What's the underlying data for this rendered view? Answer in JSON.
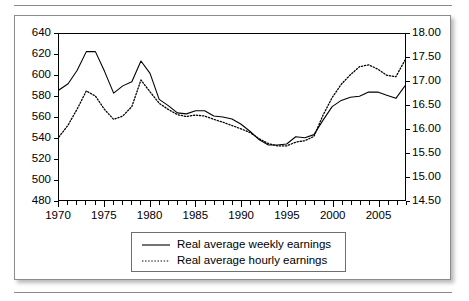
{
  "chart_data": {
    "type": "line",
    "title": "",
    "subtitle": "",
    "xlabel": "",
    "ylabel": "",
    "grid": false,
    "legend_position": "bottom-center",
    "x": [
      1970,
      1971,
      1972,
      1973,
      1974,
      1975,
      1976,
      1977,
      1978,
      1979,
      1980,
      1981,
      1982,
      1983,
      1984,
      1985,
      1986,
      1987,
      1988,
      1989,
      1990,
      1991,
      1992,
      1993,
      1994,
      1995,
      1996,
      1997,
      1998,
      1999,
      2000,
      2001,
      2002,
      2003,
      2004,
      2005,
      2006,
      2007,
      2008
    ],
    "xlim": [
      1970,
      2008
    ],
    "xticks": [
      1970,
      1975,
      1980,
      1985,
      1990,
      1995,
      2000,
      2005
    ],
    "xticklabels": [
      "1970",
      "1975",
      "1980",
      "1985",
      "1990",
      "1995",
      "2000",
      "2005"
    ],
    "minor_xticks_every": 1,
    "axes": [
      {
        "id": "left",
        "name": "Real average weekly earnings",
        "ylim": [
          480,
          640
        ],
        "yticks": [
          480,
          500,
          520,
          540,
          560,
          580,
          600,
          620,
          640
        ],
        "yticklabels": [
          "480",
          "500",
          "520",
          "540",
          "560",
          "580",
          "600",
          "620",
          "640"
        ]
      },
      {
        "id": "right",
        "name": "Real average hourly earnings",
        "ylim": [
          14.5,
          18.0
        ],
        "yticks": [
          14.5,
          15.0,
          15.5,
          16.0,
          16.5,
          17.0,
          17.5,
          18.0
        ],
        "yticklabels": [
          "14.50",
          "15.00",
          "15.50",
          "16.00",
          "16.50",
          "17.00",
          "17.50",
          "18.00"
        ]
      }
    ],
    "series": [
      {
        "name": "Real average weekly earnings",
        "axis": "left",
        "style": "solid",
        "color": "#000000",
        "values": [
          586,
          592,
          605,
          623,
          623,
          604,
          583,
          590,
          594,
          614,
          602,
          577,
          571,
          564,
          563,
          566,
          566,
          561,
          560,
          558,
          553,
          546,
          538,
          533,
          533,
          534,
          541,
          540,
          543,
          557,
          570,
          576,
          579,
          580,
          584,
          584,
          581,
          578,
          590
        ]
      },
      {
        "name": "Real average hourly earnings",
        "axis": "right",
        "style": "dotted",
        "color": "#000000",
        "values": [
          15.83,
          16.08,
          16.42,
          16.8,
          16.69,
          16.41,
          16.2,
          16.27,
          16.47,
          17.03,
          16.78,
          16.54,
          16.41,
          16.3,
          16.26,
          16.29,
          16.27,
          16.2,
          16.14,
          16.07,
          16.0,
          15.92,
          15.79,
          15.69,
          15.64,
          15.64,
          15.72,
          15.75,
          15.84,
          16.29,
          16.66,
          16.94,
          17.14,
          17.31,
          17.35,
          17.26,
          17.13,
          17.1,
          17.45
        ]
      }
    ],
    "legend": [
      {
        "label": "Real average weekly earnings",
        "style": "solid"
      },
      {
        "label": "Real average hourly earnings",
        "style": "dotted"
      }
    ]
  }
}
